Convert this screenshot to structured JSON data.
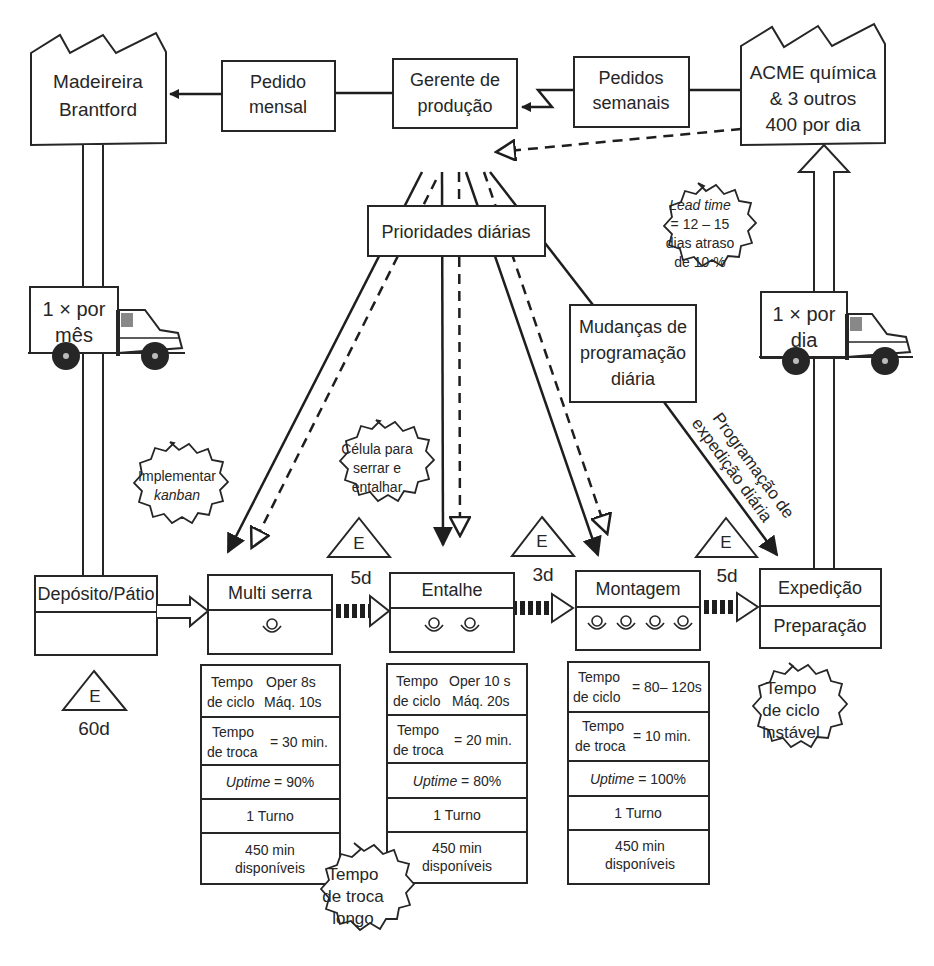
{
  "suppliers": {
    "supplier": {
      "line1": "Madeireira",
      "line2": "Brantford"
    },
    "customer": {
      "line1": "ACME química",
      "line2": "& 3 outros",
      "line3": "400 por dia"
    }
  },
  "control": {
    "monthly_order": {
      "line1": "Pedido",
      "line2": "mensal"
    },
    "production_manager": {
      "line1": "Gerente de",
      "line2": "produção"
    },
    "weekly_orders": {
      "line1": "Pedidos",
      "line2": "semanais"
    },
    "daily_priorities": "Prioridades diárias",
    "schedule_changes": {
      "line1": "Mudanças de",
      "line2": "programação",
      "line3": "diária"
    },
    "shipping_schedule": {
      "line1": "Programação de",
      "line2": "expedição diária"
    }
  },
  "shipments": {
    "inbound": {
      "line1": "1 × por",
      "line2": "mês"
    },
    "outbound": {
      "line1": "1 × por",
      "line2": "dia"
    }
  },
  "kaizen": {
    "lead_time": {
      "line1": "Lead time",
      "line2": "= 12 – 15",
      "line3": "dias atraso",
      "line4": "de 10 %"
    },
    "kanban": {
      "line1": "Implementar",
      "line2": "kanban"
    },
    "cell": {
      "line1": "Célula para",
      "line2": "serrar e",
      "line3": "entalhar"
    },
    "changeover": {
      "line1": "Tempo",
      "line2": "de troca",
      "line3": "longo"
    },
    "cycle": {
      "line1": "Tempo",
      "line2": "de ciclo",
      "line3": "instável"
    }
  },
  "inventory": [
    {
      "symbol": "E",
      "days": "60d"
    },
    {
      "symbol": "E",
      "days": "5d"
    },
    {
      "symbol": "E",
      "days": "3d"
    },
    {
      "symbol": "E",
      "days": "5d"
    }
  ],
  "processes": [
    {
      "name": "Depósito/Pátio",
      "sub": ""
    },
    {
      "name": "Multi serra",
      "operators": 1
    },
    {
      "name": "Entalhe",
      "operators": 2
    },
    {
      "name": "Montagem",
      "operators": 4
    },
    {
      "name": "Expedição",
      "sub": "Preparação"
    }
  ],
  "data_boxes": [
    {
      "cycle_a": "Tempo",
      "cycle_b": "de ciclo",
      "cycle_v1": "Oper 8s",
      "cycle_v2": "Máq. 10s",
      "co_a": "Tempo",
      "co_b": "de troca",
      "co_v": "= 30 min.",
      "uptime_label": "Uptime",
      "uptime_v": " = 90%",
      "shift": "1 Turno",
      "avail1": "450 min",
      "avail2": "disponíveis"
    },
    {
      "cycle_a": "Tempo",
      "cycle_b": "de ciclo",
      "cycle_v1": "Oper 10 s",
      "cycle_v2": "Máq. 20s",
      "co_a": "Tempo",
      "co_b": "de troca",
      "co_v": "= 20 min.",
      "uptime_label": "Uptime",
      "uptime_v": " = 80%",
      "shift": "1 Turno",
      "avail1": "450 min",
      "avail2": "disponíveis"
    },
    {
      "cycle_a": "Tempo",
      "cycle_b": "de ciclo",
      "cycle_v": "= 80– 120s",
      "co_a": "Tempo",
      "co_b": "de troca",
      "co_v": "= 10 min.",
      "uptime_label": "Uptime",
      "uptime_v": " = 100%",
      "shift": "1 Turno",
      "avail1": "450 min",
      "avail2": "disponíveis"
    }
  ]
}
